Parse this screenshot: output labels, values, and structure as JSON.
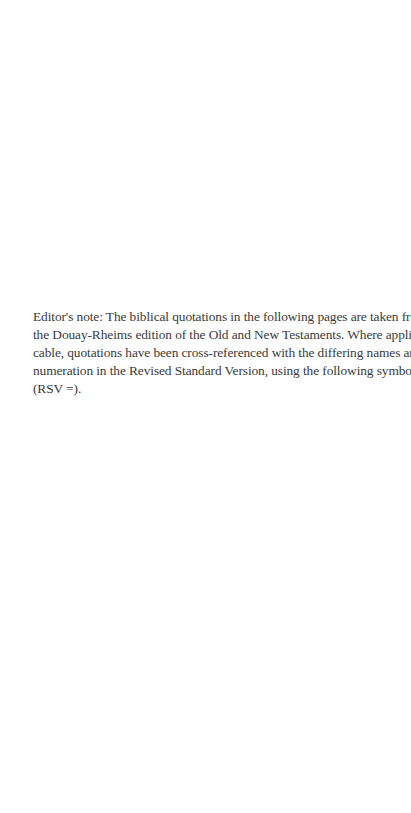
{
  "page": {
    "background": "#ffffff",
    "text_color": "#3a3a3a"
  },
  "editor_note": {
    "lines": [
      "Editor's note: The biblical quotations in the following pages are taken from",
      "the Douay-Rheims edition of the Old and New Testaments. Where appli-",
      "cable, quotations have been cross-referenced with the differing names and",
      "numeration in the Revised Standard Version, using the following symbol:",
      "(RSV =)."
    ],
    "full_text": "Editor's note: The biblical quotations in the following pages are taken from the Douay-Rheims edition of the Old and New Testaments. Where applicable, quotations have been cross-referenced with the differing names and numeration in the Revised Standard Version, using the following symbol: (RSV =)."
  }
}
